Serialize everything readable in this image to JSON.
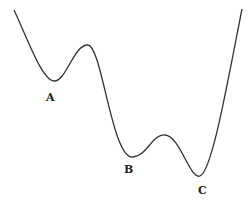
{
  "diagram": {
    "type": "energy-landscape-curve",
    "curve_color": "#333333",
    "label_color": "#222222",
    "minima": [
      {
        "label": "A",
        "x": 54,
        "y": 81
      },
      {
        "label": "B",
        "x": 133,
        "y": 157
      },
      {
        "label": "C",
        "x": 200,
        "y": 176
      }
    ],
    "maxima": [
      {
        "x": 88,
        "y": 45
      },
      {
        "x": 165,
        "y": 135
      }
    ],
    "labels": {
      "a": "A",
      "b": "B",
      "c": "C"
    }
  }
}
